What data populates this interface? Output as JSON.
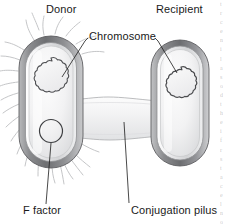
{
  "figure": {
    "type": "biology-diagram",
    "background_color": "#ffffff"
  },
  "labels": {
    "donor": "Donor",
    "recipient": "Recipient",
    "chromosome": "Chromosome",
    "f_factor": "F factor",
    "conjugation_pilus": "Conjugation pilus"
  },
  "colors": {
    "text": "#1a1a1a",
    "leader_line": "#1a1a1a",
    "cell_wall_dark": "#6f7073",
    "cell_wall_mid": "#9a9b9e",
    "cell_wall_light": "#cfd0d2",
    "cytoplasm_light": "#f3f3f4",
    "cytoplasm_mid": "#e2e2e4",
    "chromosome_stroke": "#4a4b4e",
    "f_factor_stroke": "#3a3b3e",
    "pilus_hair": "#c3c4c6",
    "bridge_fill": "#f1f1f2"
  },
  "structures": {
    "donor_cell": {
      "name": "donor-cell",
      "shape": "rod",
      "has_pili": true,
      "contains": [
        "chromosome",
        "f-factor"
      ]
    },
    "recipient_cell": {
      "name": "recipient-cell",
      "shape": "rod",
      "has_pili": false,
      "contains": [
        "chromosome"
      ]
    },
    "conjugation_bridge": {
      "name": "conjugation-pilus-bridge",
      "orientation": "horizontal",
      "connects": [
        "donor-cell",
        "recipient-cell"
      ]
    },
    "f_factor": {
      "name": "f-factor-plasmid",
      "shape": "circle",
      "located_in": "donor-cell"
    }
  },
  "edge_text_fragments": [
    "t",
    "r",
    "c",
    "e",
    "n",
    "i",
    "l",
    "a",
    "s",
    "o",
    "d",
    "t",
    "h",
    "e",
    "i",
    "f",
    "r",
    "s",
    "t",
    "a",
    "c",
    "e",
    "l",
    "n",
    "o",
    "d",
    "t",
    "i",
    "r",
    "e",
    "c",
    "f",
    "a",
    "n",
    "l",
    "s",
    "o",
    "d",
    "e",
    "t",
    "i",
    "r",
    "c",
    "e",
    "n",
    "a",
    "l",
    "s",
    "o",
    "d",
    "t",
    "h",
    "e",
    "i",
    "f",
    "r",
    "s",
    "t",
    "a",
    "c",
    "e",
    "l",
    "n",
    "o",
    "d",
    "t",
    "i",
    "r",
    "e",
    "c",
    "f",
    "a",
    "n",
    "l",
    "s",
    "o",
    "d",
    "e"
  ]
}
